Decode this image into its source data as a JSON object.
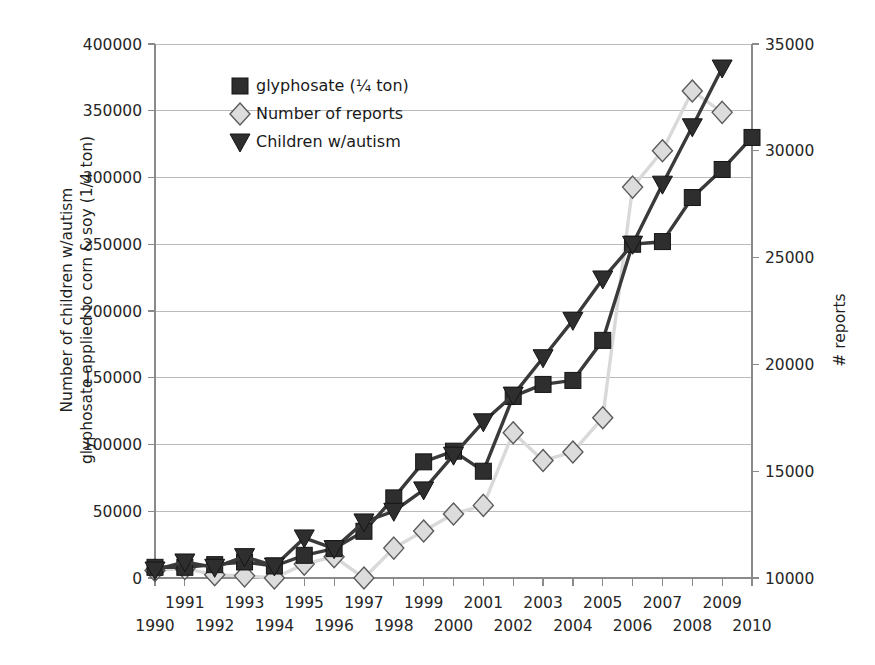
{
  "chart_data": {
    "type": "line",
    "title": "",
    "subtitle": "",
    "xlabel": "",
    "ylabel": "Number of children w/autism\nglyphosate applied to corn & soy (1/4 ton)",
    "y2label": "# reports",
    "grid": true,
    "legend_position": "top-left-inside",
    "x": [
      1990,
      1991,
      1992,
      1993,
      1994,
      1995,
      1996,
      1997,
      1998,
      1999,
      2000,
      2001,
      2002,
      2003,
      2004,
      2005,
      2006,
      2007,
      2008,
      2009,
      2010
    ],
    "categories": [
      "1990",
      "1991",
      "1992",
      "1993",
      "1994",
      "1995",
      "1996",
      "1997",
      "1998",
      "1999",
      "2000",
      "2001",
      "2002",
      "2003",
      "2004",
      "2005",
      "2006",
      "2007",
      "2008",
      "2009",
      "2010"
    ],
    "xlim": [
      1990,
      2010
    ],
    "ylim": [
      0,
      400000
    ],
    "y2lim": [
      10000,
      35000
    ],
    "yticks": [
      0,
      50000,
      100000,
      150000,
      200000,
      250000,
      300000,
      350000,
      400000
    ],
    "ytick_labels": [
      "0",
      "50000",
      "100000",
      "150000",
      "200000",
      "250000",
      "300000",
      "350000",
      "400000"
    ],
    "y2ticks": [
      10000,
      15000,
      20000,
      25000,
      30000,
      35000
    ],
    "y2tick_labels": [
      "10000",
      "15000",
      "20000",
      "25000",
      "30000",
      "35000"
    ],
    "series": [
      {
        "name": "glyphosate (¼ ton)",
        "axis": "left",
        "marker": "square",
        "color": "#2e2e2e",
        "line_color": "#3a3a3a",
        "x": [
          1990,
          1991,
          1992,
          1993,
          1994,
          1995,
          1996,
          1997,
          1998,
          1999,
          2000,
          2001,
          2002,
          2003,
          2004,
          2005,
          2006,
          2007,
          2008,
          2009,
          2010
        ],
        "values": [
          8000,
          8000,
          10000,
          12000,
          9000,
          17000,
          22000,
          35000,
          60000,
          87000,
          95000,
          80000,
          136000,
          145000,
          148000,
          178000,
          250000,
          252000,
          285000,
          306000,
          330000
        ]
      },
      {
        "name": "Number of reports",
        "axis": "right",
        "marker": "diamond",
        "color": "#dcdcdc",
        "line_color": "#d9d9d9",
        "x": [
          1990,
          1991,
          1992,
          1993,
          1994,
          1995,
          1996,
          1997,
          1998,
          1999,
          2000,
          2001,
          2002,
          2003,
          2004,
          2005,
          2006,
          2007,
          2008,
          2009
        ],
        "values_right_axis": [
          10350,
          10450,
          10150,
          10100,
          10000,
          10650,
          11000,
          10000,
          11400,
          12200,
          13000,
          13400,
          16800,
          15500,
          15900,
          17500,
          28300,
          30000,
          32800,
          31800
        ],
        "values_left_axis_equivalent": [
          5600,
          7200,
          2400,
          1600,
          0,
          10400,
          16000,
          0,
          22400,
          35200,
          48000,
          54400,
          108800,
          88000,
          94400,
          120000,
          292800,
          320000,
          364800,
          348800
        ]
      },
      {
        "name": "Children w/autism",
        "axis": "left",
        "marker": "triangle-down",
        "color": "#2e2e2e",
        "line_color": "#3a3a3a",
        "x": [
          1990,
          1991,
          1992,
          1993,
          1994,
          1995,
          1996,
          1997,
          1998,
          1999,
          2000,
          2001,
          2002,
          2003,
          2004,
          2005,
          2006,
          2007,
          2008,
          2009
        ],
        "values": [
          6000,
          12000,
          8000,
          16000,
          9000,
          30000,
          22000,
          42000,
          50000,
          66000,
          92000,
          117000,
          137000,
          165000,
          193000,
          224000,
          250000,
          295000,
          338000,
          382000
        ]
      }
    ],
    "legend_entries": [
      {
        "label": "glyphosate (¼ ton)",
        "marker": "square",
        "color": "#2e2e2e"
      },
      {
        "label": "Number of reports",
        "marker": "diamond",
        "color": "#dcdcdc"
      },
      {
        "label": "Children w/autism",
        "marker": "triangle-down",
        "color": "#2e2e2e"
      }
    ]
  },
  "axes": {
    "left_title_line1": "Number of children w/autism",
    "left_title_line2": "glyphosate applied to corn & soy (1/4 ton)",
    "right_title": "# reports"
  }
}
